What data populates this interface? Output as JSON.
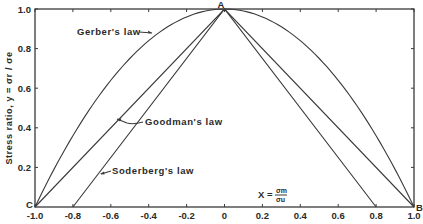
{
  "chart_data": {
    "type": "line",
    "title": "",
    "xlabel": "X = σm / σu",
    "xlabel_parts": {
      "prefix": "X =",
      "num": "σm",
      "den": "σu"
    },
    "ylabel": "Stress ratio, y = σr / σe",
    "xlim": [
      -1.0,
      1.0
    ],
    "ylim": [
      0,
      1.0
    ],
    "grid": false,
    "x_ticks": [
      -1.0,
      -0.8,
      -0.6,
      -0.4,
      -0.2,
      0,
      0.2,
      0.4,
      0.6,
      0.8,
      1.0
    ],
    "x_tick_labels": [
      "-1.0",
      "-0.8",
      "-0.6",
      "-0.4",
      "-0.2",
      "0",
      "0.2",
      "0.4",
      "0.6",
      "0.8",
      "1.0"
    ],
    "y_ticks": [
      0.2,
      0.4,
      0.6,
      0.8,
      1.0
    ],
    "y_tick_labels": [
      "0.2",
      "0.4",
      "0.6",
      "0.8",
      "1.0"
    ],
    "points": [
      {
        "label": "A",
        "x": 0,
        "y": 1.0
      },
      {
        "label": "B",
        "x": 1.0,
        "y": 0
      },
      {
        "label": "C",
        "x": -1.0,
        "y": 0
      }
    ],
    "series": [
      {
        "name": "Gerber's law",
        "equation": "y = 1 - x^2",
        "x": [
          -1.0,
          -0.8,
          -0.6,
          -0.4,
          -0.2,
          0,
          0.2,
          0.4,
          0.6,
          0.8,
          1.0
        ],
        "values": [
          0,
          0.36,
          0.64,
          0.84,
          0.96,
          1.0,
          0.96,
          0.84,
          0.64,
          0.36,
          0
        ]
      },
      {
        "name": "Goodman's law",
        "equation": "y = 1 - |x|",
        "x": [
          -1.0,
          0,
          1.0
        ],
        "values": [
          0,
          1.0,
          0
        ]
      },
      {
        "name": "Soderberg's law",
        "equation": "y = 1 - |x|/0.8",
        "x": [
          -0.8,
          0,
          0.8
        ],
        "values": [
          0,
          1.0,
          0
        ]
      }
    ],
    "annotations": [
      {
        "text": "Gerber's law",
        "points_to": "Gerber's law curve near x=-0.45"
      },
      {
        "text": "Goodman's law",
        "points_to": "Goodman's law line near x=-0.55"
      },
      {
        "text": "Soderberg's law",
        "points_to": "Soderberg's law line near x=-0.65"
      }
    ]
  }
}
